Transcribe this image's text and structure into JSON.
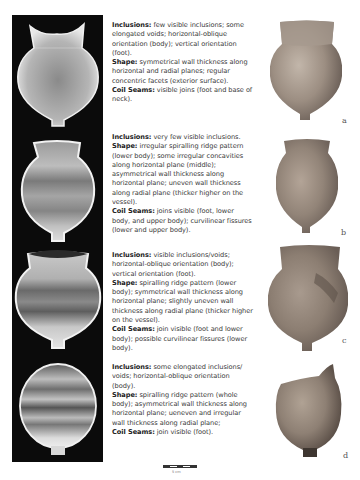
{
  "figure": {
    "panels": [
      {
        "label": "a",
        "inclusions_heading": "Inclusions:",
        "inclusions_text": " few visible inclusions; some elongated voids; horizontal-oblique orientation (body); vertical orientation (foot).",
        "shape_heading": "Shape:",
        "shape_text": " symmetrical wall thickness along horizontal and radial planes; regular concentric facets (exterior surface).",
        "seams_heading": "Coil Seams:",
        "seams_text": " visible joins (foot and base of neck)."
      },
      {
        "label": "b",
        "inclusions_heading": "Inclusions:",
        "inclusions_text": " very few visible inclusions.",
        "shape_heading": "Shape:",
        "shape_text": " irregular spiralling ridge pattern (lower body); some irregular concavities along horizontal plane (middle); asymmetrical wall thickness along horizontal plane; uneven wall thickness along radial plane (thicker higher on the vessel).",
        "seams_heading": "Coil Seams:",
        "seams_text": " joins visible (foot, lower body, and upper body); curvilinear fissures (lower and upper body)."
      },
      {
        "label": "c",
        "inclusions_heading": "Inclusions:",
        "inclusions_text": " visible inclusions/voids; horizontal-oblique orientation (body); vertical orientation (foot).",
        "shape_heading": "Shape:",
        "shape_text": " spiralling ridge pattern (lower body); symmetrical wall thickness along horizontal plane; slightly uneven wall thickness along radial plane (thicker higher on the vessel).",
        "seams_heading": "Coil Seams:",
        "seams_text": " join visible (foot and lower body); possible curvilinear fissures (lower body)."
      },
      {
        "label": "d",
        "inclusions_heading": "Inclusions:",
        "inclusions_text": " some elongated inclusions/ voids; horizontal-oblique orientation (body).",
        "shape_heading": "Shape:",
        "shape_text": " spiralling ridge pattern (whole body); asymmetrical wall thickness along horizontal plane; ueneven and irregular wall thickness along radial plane;",
        "seams_heading": "Coil Seams:",
        "seams_text": " join visible (foot)."
      }
    ],
    "scale_bar": {
      "label": "5 cm"
    }
  },
  "colors": {
    "xray_background": "#0b0b0b",
    "pottery_clay": "#9e8a78"
  }
}
